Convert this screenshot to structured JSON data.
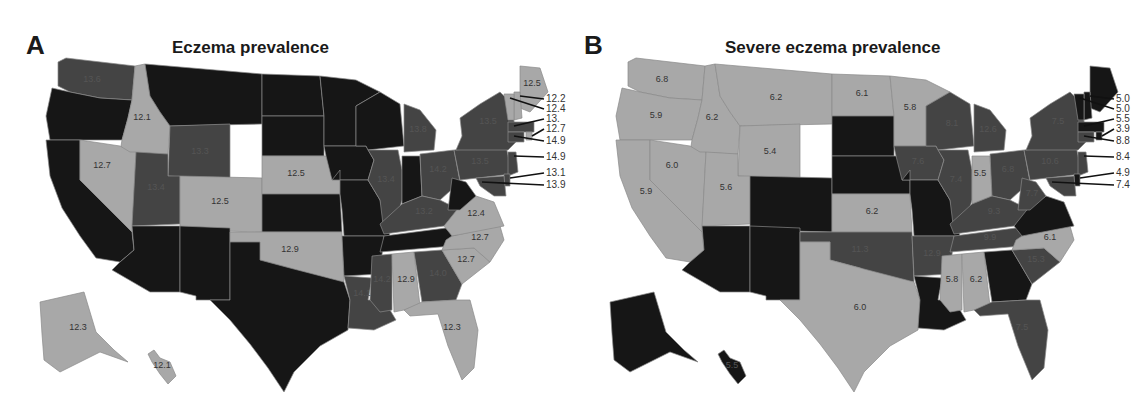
{
  "colors": {
    "light": "#a8a8a8",
    "medium": "#444444",
    "dark": "#161616",
    "text": "#1a1a1a"
  },
  "panels": [
    {
      "letter": "A",
      "title": "Eczema prevalence"
    },
    {
      "letter": "B",
      "title": "Severe eczema prevalence"
    }
  ],
  "chart_data": [
    {
      "type": "choropleth",
      "title": "Eczema prevalence",
      "panel": "A",
      "legend": "none (grayscale tiers: light < medium < dark)",
      "states": {
        "WA": {
          "value": 13.6,
          "tier": "medium"
        },
        "OR": {
          "value": null,
          "tier": "dark"
        },
        "CA": {
          "value": null,
          "tier": "dark"
        },
        "ID": {
          "value": 12.1,
          "tier": "light"
        },
        "NV": {
          "value": 12.7,
          "tier": "light"
        },
        "MT": {
          "value": null,
          "tier": "dark"
        },
        "WY": {
          "value": 13.3,
          "tier": "medium"
        },
        "UT": {
          "value": 13.4,
          "tier": "medium"
        },
        "CO": {
          "value": 12.5,
          "tier": "light"
        },
        "AZ": {
          "value": null,
          "tier": "dark"
        },
        "NM": {
          "value": null,
          "tier": "dark"
        },
        "ND": {
          "value": null,
          "tier": "dark"
        },
        "SD": {
          "value": null,
          "tier": "dark"
        },
        "NE": {
          "value": 12.5,
          "tier": "light"
        },
        "KS": {
          "value": null,
          "tier": "dark"
        },
        "OK": {
          "value": 12.9,
          "tier": "light"
        },
        "TX": {
          "value": null,
          "tier": "dark"
        },
        "MN": {
          "value": null,
          "tier": "dark"
        },
        "IA": {
          "value": null,
          "tier": "dark"
        },
        "MO": {
          "value": null,
          "tier": "dark"
        },
        "AR": {
          "value": null,
          "tier": "dark"
        },
        "LA": {
          "value": 14.1,
          "tier": "medium"
        },
        "WI": {
          "value": null,
          "tier": "dark"
        },
        "IL": {
          "value": 13.4,
          "tier": "medium"
        },
        "MI": {
          "value": 13.8,
          "tier": "medium"
        },
        "IN": {
          "value": null,
          "tier": "dark"
        },
        "OH": {
          "value": 14.2,
          "tier": "medium"
        },
        "KY": {
          "value": 13.2,
          "tier": "medium"
        },
        "TN": {
          "value": null,
          "tier": "dark"
        },
        "MS": {
          "value": 14.2,
          "tier": "medium"
        },
        "AL": {
          "value": 12.9,
          "tier": "light"
        },
        "GA": {
          "value": 14.0,
          "tier": "medium"
        },
        "FL": {
          "value": 12.3,
          "tier": "light"
        },
        "SC": {
          "value": 12.7,
          "tier": "light"
        },
        "NC": {
          "value": 12.7,
          "tier": "light"
        },
        "VA": {
          "value": 12.4,
          "tier": "light"
        },
        "WV": {
          "value": null,
          "tier": "dark"
        },
        "PA": {
          "value": 13.5,
          "tier": "medium"
        },
        "NY": {
          "value": 13.5,
          "tier": "medium"
        },
        "ME": {
          "value": 12.5,
          "tier": "light"
        },
        "NH": {
          "value": 12.2,
          "tier": "light"
        },
        "VT": {
          "value": 12.4,
          "tier": "light"
        },
        "MA": {
          "value": 13.1,
          "tier": "medium"
        },
        "RI": {
          "value": 12.7,
          "tier": "light"
        },
        "CT": {
          "value": 14.9,
          "tier": "medium"
        },
        "NJ": {
          "value": 14.9,
          "tier": "medium"
        },
        "DE": {
          "value": 13.1,
          "tier": "medium"
        },
        "MD": {
          "value": 13.9,
          "tier": "medium"
        },
        "AK": {
          "value": 12.3,
          "tier": "light"
        },
        "HI": {
          "value": 12.1,
          "tier": "light"
        }
      },
      "callouts": [
        "12.2",
        "12.4",
        "13.1",
        "12.7",
        "14.9",
        "14.9",
        "13.1",
        "13.9"
      ]
    },
    {
      "type": "choropleth",
      "title": "Severe eczema prevalence",
      "panel": "B",
      "legend": "none (grayscale tiers: light < medium < dark)",
      "states": {
        "WA": {
          "value": 6.8,
          "tier": "light"
        },
        "OR": {
          "value": 5.9,
          "tier": "light"
        },
        "CA": {
          "value": 5.9,
          "tier": "light"
        },
        "ID": {
          "value": 6.2,
          "tier": "light"
        },
        "NV": {
          "value": 6.0,
          "tier": "light"
        },
        "MT": {
          "value": 6.2,
          "tier": "light"
        },
        "WY": {
          "value": 5.4,
          "tier": "light"
        },
        "UT": {
          "value": 5.6,
          "tier": "light"
        },
        "CO": {
          "value": null,
          "tier": "dark"
        },
        "AZ": {
          "value": null,
          "tier": "dark"
        },
        "NM": {
          "value": null,
          "tier": "dark"
        },
        "ND": {
          "value": 6.1,
          "tier": "light"
        },
        "SD": {
          "value": null,
          "tier": "dark"
        },
        "NE": {
          "value": null,
          "tier": "dark"
        },
        "KS": {
          "value": 6.2,
          "tier": "light"
        },
        "OK": {
          "value": 11.3,
          "tier": "medium"
        },
        "TX": {
          "value": 6.0,
          "tier": "light"
        },
        "MN": {
          "value": 5.8,
          "tier": "light"
        },
        "IA": {
          "value": 7.6,
          "tier": "medium"
        },
        "MO": {
          "value": null,
          "tier": "dark"
        },
        "AR": {
          "value": 12.9,
          "tier": "medium"
        },
        "LA": {
          "value": null,
          "tier": "dark"
        },
        "WI": {
          "value": 8.1,
          "tier": "medium"
        },
        "IL": {
          "value": 7.4,
          "tier": "medium"
        },
        "MI": {
          "value": 12.6,
          "tier": "medium"
        },
        "IN": {
          "value": 5.5,
          "tier": "light"
        },
        "OH": {
          "value": 6.8,
          "tier": "medium"
        },
        "KY": {
          "value": 9.3,
          "tier": "medium"
        },
        "TN": {
          "value": 9.9,
          "tier": "medium"
        },
        "MS": {
          "value": 5.8,
          "tier": "light"
        },
        "AL": {
          "value": 6.2,
          "tier": "light"
        },
        "GA": {
          "value": null,
          "tier": "dark"
        },
        "FL": {
          "value": 7.5,
          "tier": "medium"
        },
        "SC": {
          "value": 15.3,
          "tier": "medium"
        },
        "NC": {
          "value": 6.1,
          "tier": "light"
        },
        "VA": {
          "value": null,
          "tier": "dark"
        },
        "WV": {
          "value": 7.7,
          "tier": "medium"
        },
        "PA": {
          "value": 10.6,
          "tier": "medium"
        },
        "NY": {
          "value": 7.5,
          "tier": "medium"
        },
        "ME": {
          "value": null,
          "tier": "dark"
        },
        "NH": {
          "value": 5.0,
          "tier": "dark"
        },
        "VT": {
          "value": 5.0,
          "tier": "dark"
        },
        "MA": {
          "value": 5.5,
          "tier": "dark"
        },
        "RI": {
          "value": 3.9,
          "tier": "dark"
        },
        "CT": {
          "value": 8.8,
          "tier": "medium"
        },
        "NJ": {
          "value": 8.4,
          "tier": "medium"
        },
        "DE": {
          "value": 4.9,
          "tier": "dark"
        },
        "MD": {
          "value": 7.4,
          "tier": "medium"
        },
        "AK": {
          "value": null,
          "tier": "dark"
        },
        "HI": {
          "value": 5.5,
          "tier": "dark"
        }
      },
      "callouts": [
        "5.0",
        "5.0",
        "5.5",
        "3.9",
        "8.8",
        "8.4",
        "4.9",
        "7.4"
      ]
    }
  ],
  "labels": {
    "A": {
      "WA": "13.6",
      "ID": "12.1",
      "NV": "12.7",
      "WY": "13.3",
      "UT": "13.4",
      "CO": "12.5",
      "NE": "12.5",
      "OK": "12.9",
      "IL": "13.4",
      "MI": "13.8",
      "OH": "14.2",
      "KY": "13.2",
      "PA": "13.5",
      "NY": "13.5",
      "VA": "12.4",
      "NC": "12.7",
      "SC": "12.7",
      "GA": "14.0",
      "AL": "12.9",
      "MS": "14.2",
      "LA": "14.1",
      "FL": "12.3",
      "ME": "12.5",
      "AK": "12.3",
      "HI": "12.1"
    },
    "B": {
      "WA": "6.8",
      "OR": "5.9",
      "CA": "5.9",
      "ID": "6.2",
      "NV": "6.0",
      "MT": "6.2",
      "WY": "5.4",
      "UT": "5.6",
      "ND": "6.1",
      "KS": "6.2",
      "OK": "11.3",
      "TX": "6.0",
      "MN": "5.8",
      "IA": "7.6",
      "AR": "12.9",
      "WI": "8.1",
      "IL": "7.4",
      "MI": "12.6",
      "IN": "5.5",
      "OH": "6.8",
      "KY": "9.3",
      "TN": "9.9",
      "MS": "5.8",
      "AL": "6.2",
      "FL": "7.5",
      "SC": "15.3",
      "NC": "6.1",
      "WV": "7.7",
      "PA": "10.6",
      "NY": "7.5",
      "HI": "5.5"
    }
  },
  "callouts": {
    "A": [
      "12.2",
      "12.4",
      "13.",
      "12.7",
      "14.9",
      "14.9",
      "13.1",
      "13.9"
    ],
    "B": [
      "5.0",
      "5.0",
      "5.5",
      "3.9",
      "8.8",
      "8.4",
      "4.9",
      "7.4"
    ]
  }
}
